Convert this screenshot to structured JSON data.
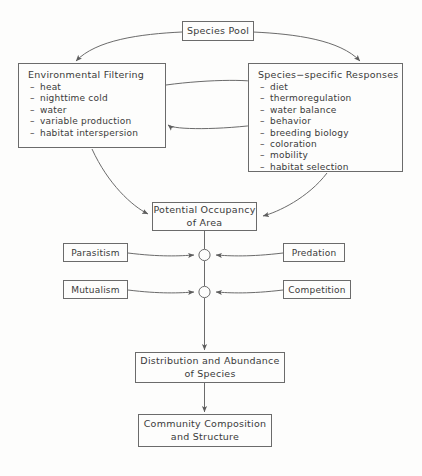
{
  "diagram": {
    "line_color": "#6b6b6b",
    "text_color": "#3a3a3a",
    "background": "#fdfdfc"
  },
  "nodes": {
    "species_pool": {
      "label": "Species Pool"
    },
    "environmental_filtering": {
      "title": "Environmental Filtering",
      "items": [
        "heat",
        "nighttime cold",
        "water",
        "variable production",
        "habitat interspersion"
      ]
    },
    "species_specific_responses": {
      "title": "Species−specific Responses",
      "items": [
        "diet",
        "thermoregulation",
        "water balance",
        "behavior",
        "breeding biology",
        "coloration",
        "mobility",
        "habitat selection"
      ]
    },
    "potential_occupancy": {
      "line1": "Potential Occupancy",
      "line2": "of Area"
    },
    "parasitism": {
      "label": "Parasitism"
    },
    "predation": {
      "label": "Predation"
    },
    "mutualism": {
      "label": "Mutualism"
    },
    "competition": {
      "label": "Competition"
    },
    "distribution_abundance": {
      "line1": "Distribution and Abundance",
      "line2": "of Species"
    },
    "community_composition": {
      "line1": "Community Composition",
      "line2": "and Structure"
    }
  }
}
